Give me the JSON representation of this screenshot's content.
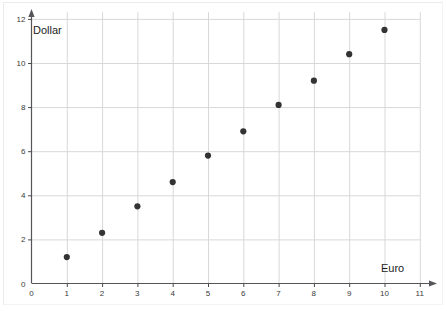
{
  "chart_data": {
    "type": "scatter",
    "title": "",
    "xlabel": "Euro",
    "ylabel": "Dollar",
    "xlim": [
      0,
      11.6
    ],
    "ylim": [
      0,
      12.3
    ],
    "xticks": [
      0,
      1,
      2,
      3,
      4,
      5,
      6,
      7,
      8,
      9,
      10,
      11
    ],
    "yticks": [
      0,
      2,
      4,
      6,
      8,
      10,
      12
    ],
    "xtick_labels": [
      "0",
      "1",
      "2",
      "3",
      "4",
      "5",
      "6",
      "7",
      "8",
      "9",
      "10",
      "11"
    ],
    "ytick_labels": [
      "0",
      "2",
      "4",
      "6",
      "8",
      "10",
      "12"
    ],
    "grid": true,
    "grid_x_values": [
      1,
      2,
      3,
      4,
      5,
      6,
      7,
      8,
      9,
      10,
      11
    ],
    "grid_y_values": [
      2,
      4,
      6,
      8,
      10,
      12
    ],
    "legend": null,
    "x": [
      1,
      2,
      3,
      4,
      5,
      6,
      7,
      8,
      9,
      10
    ],
    "y": [
      1.2,
      2.3,
      3.5,
      4.6,
      5.8,
      6.9,
      8.1,
      9.2,
      10.4,
      11.5
    ],
    "points": [
      {
        "x": 1,
        "y": 1.2
      },
      {
        "x": 2,
        "y": 2.3
      },
      {
        "x": 3,
        "y": 3.5
      },
      {
        "x": 4,
        "y": 4.6
      },
      {
        "x": 5,
        "y": 5.8
      },
      {
        "x": 6,
        "y": 6.9
      },
      {
        "x": 7,
        "y": 8.1
      },
      {
        "x": 8,
        "y": 9.2
      },
      {
        "x": 9,
        "y": 10.4
      },
      {
        "x": 10,
        "y": 11.5
      }
    ],
    "marker": "filled-circle",
    "marker_color": "#333333",
    "grid_color": "#d8d8d8",
    "axis_color": "#4a4a4a",
    "background_color": "#ffffff"
  }
}
